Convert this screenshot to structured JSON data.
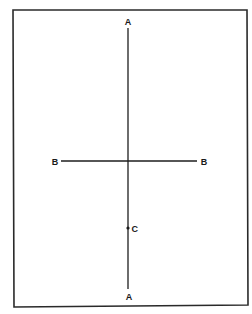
{
  "diagram": {
    "frame": {
      "x": 13,
      "y": 10,
      "width": 235,
      "height": 296
    },
    "vertical_line": {
      "label_top": "A",
      "label_bottom": "A",
      "x": 128,
      "y_start": 28,
      "y_end": 289
    },
    "horizontal_line": {
      "label_left": "B",
      "label_right": "B",
      "y": 161,
      "x_start": 61,
      "x_end": 197
    },
    "point": {
      "label": "C",
      "x": 128,
      "y": 228
    },
    "colors": {
      "line": "#1e1e1e",
      "frame": "#2a2a2a",
      "background": "#ffffff"
    }
  }
}
